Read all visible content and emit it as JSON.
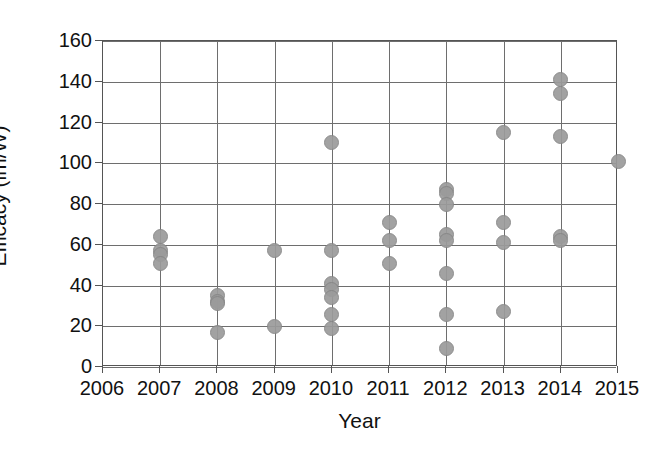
{
  "chart_data": {
    "type": "scatter",
    "title": "",
    "xlabel": "Year",
    "ylabel": "Efficacy (lm/W)",
    "xlim": [
      2006,
      2015
    ],
    "ylim": [
      0,
      160
    ],
    "xticks": [
      2006,
      2007,
      2008,
      2009,
      2010,
      2011,
      2012,
      2013,
      2014,
      2015
    ],
    "yticks": [
      0,
      20,
      40,
      60,
      80,
      100,
      120,
      140,
      160
    ],
    "xtick_labels": [
      "2006",
      "2007",
      "2008",
      "2009",
      "2010",
      "2011",
      "2012",
      "2013",
      "2014",
      "2015"
    ],
    "ytick_labels": [
      "0",
      "20",
      "40",
      "60",
      "80",
      "100",
      "120",
      "140",
      "160"
    ],
    "grid": true,
    "legend": false,
    "marker_color": "#9b9b9b",
    "marker_edge_color": "#858585",
    "points": [
      {
        "x": 2007,
        "y": 64
      },
      {
        "x": 2007,
        "y": 57
      },
      {
        "x": 2007,
        "y": 55
      },
      {
        "x": 2007,
        "y": 51
      },
      {
        "x": 2008,
        "y": 35
      },
      {
        "x": 2008,
        "y": 32
      },
      {
        "x": 2008,
        "y": 31
      },
      {
        "x": 2008,
        "y": 17
      },
      {
        "x": 2009,
        "y": 57
      },
      {
        "x": 2009,
        "y": 20
      },
      {
        "x": 2010,
        "y": 110
      },
      {
        "x": 2010,
        "y": 57
      },
      {
        "x": 2010,
        "y": 41
      },
      {
        "x": 2010,
        "y": 38
      },
      {
        "x": 2010,
        "y": 34
      },
      {
        "x": 2010,
        "y": 26
      },
      {
        "x": 2010,
        "y": 19
      },
      {
        "x": 2011,
        "y": 71
      },
      {
        "x": 2011,
        "y": 62
      },
      {
        "x": 2011,
        "y": 51
      },
      {
        "x": 2012,
        "y": 87
      },
      {
        "x": 2012,
        "y": 85
      },
      {
        "x": 2012,
        "y": 80
      },
      {
        "x": 2012,
        "y": 65
      },
      {
        "x": 2012,
        "y": 62
      },
      {
        "x": 2012,
        "y": 46
      },
      {
        "x": 2012,
        "y": 26
      },
      {
        "x": 2012,
        "y": 9
      },
      {
        "x": 2013,
        "y": 115
      },
      {
        "x": 2013,
        "y": 71
      },
      {
        "x": 2013,
        "y": 61
      },
      {
        "x": 2013,
        "y": 27
      },
      {
        "x": 2014,
        "y": 141
      },
      {
        "x": 2014,
        "y": 134
      },
      {
        "x": 2014,
        "y": 113
      },
      {
        "x": 2014,
        "y": 64
      },
      {
        "x": 2014,
        "y": 62
      },
      {
        "x": 2015,
        "y": 101
      }
    ]
  }
}
